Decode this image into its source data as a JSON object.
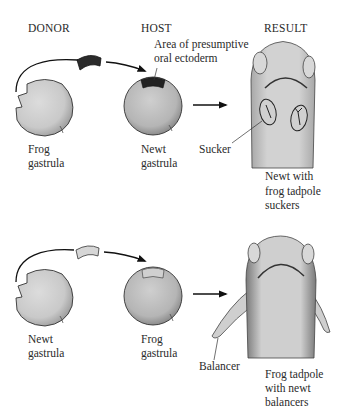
{
  "headers": {
    "donor": "DONOR",
    "host": "HOST",
    "result": "RESULT"
  },
  "top_row": {
    "annotation": {
      "line1": "Area of presumptive",
      "line2": "oral ectoderm"
    },
    "donor": {
      "line1": "Frog",
      "line2": "gastrula"
    },
    "host": {
      "line1": "Newt",
      "line2": "gastrula"
    },
    "result_part_label": "Sucker",
    "result_caption": {
      "line1": "Newt with",
      "line2": "frog tadpole",
      "line3": "suckers"
    },
    "graft_color": "#2b2b2b"
  },
  "bottom_row": {
    "donor": {
      "line1": "Newt",
      "line2": "gastrula"
    },
    "host": {
      "line1": "Frog",
      "line2": "gastrula"
    },
    "result_part_label": "Balancer",
    "result_caption": {
      "line1": "Frog tadpole",
      "line2": "with newt",
      "line3": "balancers"
    },
    "graft_color": "#d6d6d6"
  },
  "colors": {
    "embryo_fill": "#d4d4d4",
    "embryo_stroke": "#333333",
    "arrow": "#111111",
    "background": "#ffffff"
  }
}
